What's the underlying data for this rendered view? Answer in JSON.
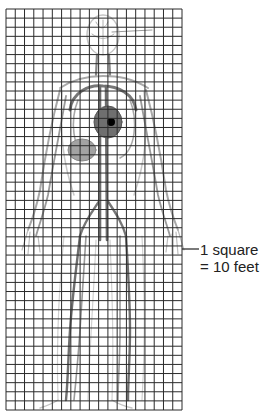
{
  "figure": {
    "grid": {
      "columns": 19,
      "rows": 44,
      "left": 6,
      "top": 9,
      "right": 182,
      "bottom": 410,
      "line_color": "#2b2b2b"
    },
    "heart_marker": {
      "x": 111,
      "y": 122,
      "color": "#000000"
    },
    "body_color": "#8a8a8a"
  },
  "scale_label": {
    "line1": "1 square",
    "line2": "= 10 feet"
  }
}
